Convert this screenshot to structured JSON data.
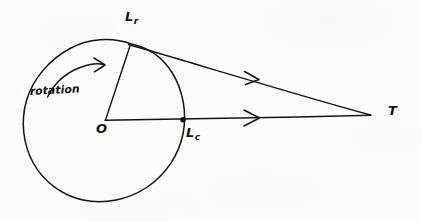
{
  "diagram": {
    "kind": "hand-drawn-geometry-sketch",
    "ink_color": "#17140f",
    "background_color": "#fcfcfb",
    "labels": {
      "center": {
        "text": "O",
        "name": "center-point-label"
      },
      "rotating_point": {
        "base": "L",
        "subscript": "r",
        "name": "point-Lr-label"
      },
      "circle_point": {
        "base": "L",
        "subscript": "c",
        "name": "point-Lc-label"
      },
      "apex": {
        "text": "T",
        "name": "point-T-label"
      },
      "rotation": {
        "text": "rotation",
        "name": "rotation-annotation"
      }
    },
    "geometry": {
      "circle": {
        "cx": 105,
        "cy": 120,
        "r": 80
      },
      "points": {
        "O": {
          "x": 105,
          "y": 120
        },
        "Lr": {
          "x": 131,
          "y": 44
        },
        "Lc": {
          "x": 183,
          "y": 120
        },
        "T": {
          "x": 371,
          "y": 115
        }
      },
      "segments": [
        {
          "name": "radius-O-Lr",
          "from": "O",
          "to": "Lr",
          "arrow": false
        },
        {
          "name": "sight-line-Lr-T",
          "from": "Lr",
          "to": "T",
          "arrow": true
        },
        {
          "name": "sight-line-O-T",
          "from": "O",
          "to": "T",
          "arrow": true
        }
      ],
      "rotation_arrow": {
        "direction": "clockwise",
        "start": {
          "x": 48,
          "y": 96
        },
        "end": {
          "x": 104,
          "y": 66
        }
      }
    }
  }
}
